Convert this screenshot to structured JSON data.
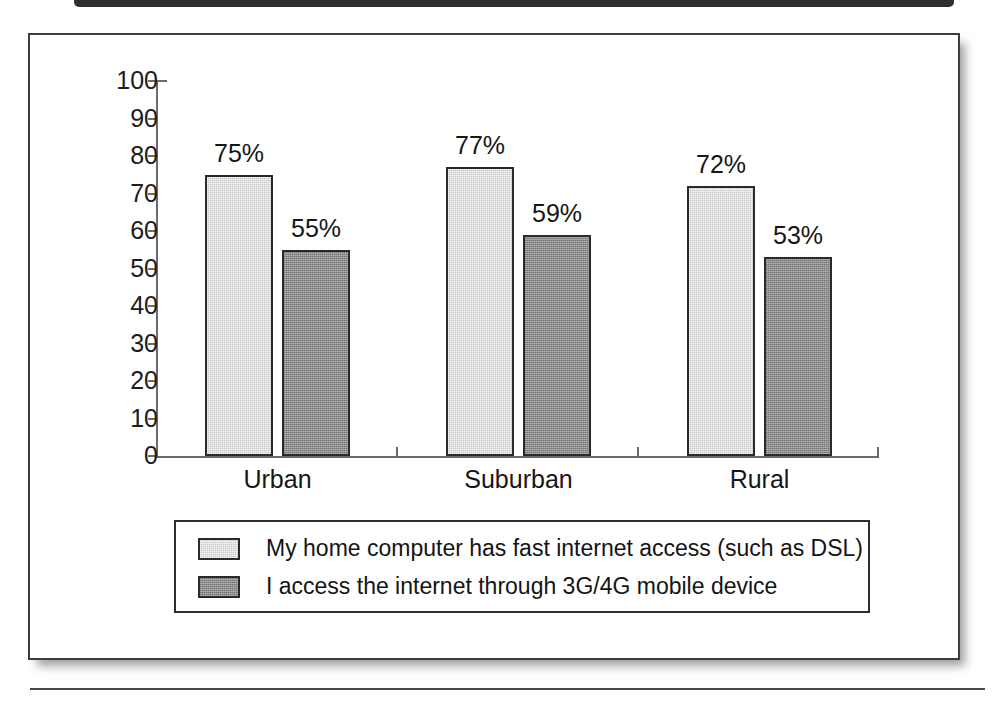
{
  "chart_data": {
    "type": "bar",
    "title": "",
    "xlabel": "",
    "ylabel": "",
    "categories": [
      "Urban",
      "Suburban",
      "Rural"
    ],
    "ylim": [
      0,
      100
    ],
    "y_ticks": [
      0,
      10,
      20,
      30,
      40,
      50,
      60,
      70,
      80,
      90,
      100
    ],
    "grid": false,
    "legend_position": "bottom",
    "value_label_suffix": "%",
    "series": [
      {
        "name": "My home computer has fast internet access (such as DSL)",
        "color": "#c9c9c9",
        "values": [
          75,
          77,
          72
        ],
        "value_labels": [
          "75%",
          "77%",
          "72%"
        ]
      },
      {
        "name": "I access the internet through 3G/4G mobile device",
        "color": "#8c8c8c",
        "values": [
          55,
          59,
          53
        ],
        "value_labels": [
          "55%",
          "59%",
          "53%"
        ]
      }
    ]
  },
  "axis": {
    "tick_labels": [
      "100",
      "90",
      "80",
      "70",
      "60",
      "50",
      "40",
      "30",
      "20",
      "10",
      "0"
    ]
  },
  "legend": {
    "entries": [
      {
        "label": "My home computer has fast internet access (such as DSL)"
      },
      {
        "label": "I access the internet through 3G/4G mobile device"
      }
    ]
  },
  "colors": {
    "series_light": "#c9c9c9",
    "series_dark": "#8c8c8c",
    "outline": "#2a2a2a",
    "axis": "#6b6b6b",
    "text": "#161616",
    "page_border": "#3d3d3d"
  }
}
